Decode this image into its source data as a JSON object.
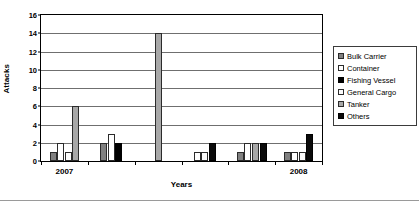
{
  "chart_data": {
    "type": "bar",
    "title": "",
    "xlabel": "Years",
    "ylabel": "Attacks",
    "ylim": [
      0,
      16
    ],
    "ytick_step": 2,
    "yticks": [
      0,
      2,
      4,
      6,
      8,
      10,
      12,
      14,
      16
    ],
    "grid": true,
    "legend_position": "right",
    "categories": [
      "2007",
      "",
      "",
      "",
      "",
      "2008"
    ],
    "xtick_labels_visible": [
      "2007",
      "2008"
    ],
    "series": [
      {
        "name": "Bulk Carrier",
        "color": "#808080",
        "values": [
          1,
          2,
          0,
          0,
          1,
          1
        ]
      },
      {
        "name": "Container",
        "color": "#ffffff",
        "values": [
          2,
          3,
          0,
          1,
          2,
          1
        ]
      },
      {
        "name": "Fishing Vessel",
        "color": "#000000",
        "values": [
          0,
          2,
          0,
          0,
          0,
          0
        ]
      },
      {
        "name": "General Cargo",
        "color": "#fbfbfb",
        "values": [
          1,
          0,
          0,
          1,
          0,
          1
        ]
      },
      {
        "name": "Tanker",
        "color": "#a8a8a8",
        "values": [
          6,
          0,
          14,
          0,
          2,
          0
        ]
      },
      {
        "name": "Others",
        "color": "#0a0a0a",
        "values": [
          0,
          0,
          0,
          2,
          2,
          3
        ]
      }
    ]
  },
  "axes": {
    "y_title": "Attacks",
    "x_title": "Years",
    "y_ticks": [
      "0",
      "2",
      "4",
      "6",
      "8",
      "10",
      "12",
      "14",
      "16"
    ],
    "x_ticks": [
      "2007",
      "2008"
    ]
  },
  "legend": {
    "items": [
      {
        "label": "Bulk Carrier",
        "swatch": "bulk"
      },
      {
        "label": "Container",
        "swatch": "container"
      },
      {
        "label": "Fishing Vessel",
        "swatch": "fishing"
      },
      {
        "label": "General Cargo",
        "swatch": "cargo"
      },
      {
        "label": "Tanker",
        "swatch": "tanker"
      },
      {
        "label": "Others",
        "swatch": "others"
      }
    ]
  }
}
